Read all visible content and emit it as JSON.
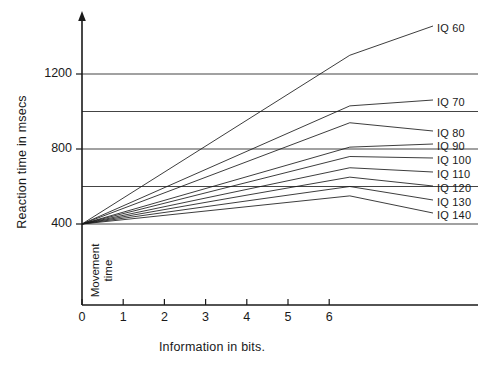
{
  "chart_data": {
    "type": "line",
    "title": "",
    "xlabel": "Information in bits.",
    "ylabel": "Reaction time in msecs",
    "xlim": [
      0,
      6.6
    ],
    "ylim": [
      300,
      1400
    ],
    "xticks": [
      0,
      1,
      2,
      3,
      4,
      5,
      6
    ],
    "xticklabels": [
      "0",
      "1",
      "2",
      "3",
      "4",
      "5",
      "6"
    ],
    "yticks": [
      400,
      800,
      1200
    ],
    "yticklabels": [
      "400",
      "800",
      "1200"
    ],
    "gridlines_y": [
      400,
      600,
      800,
      1000,
      1200
    ],
    "grid": true,
    "legend_position": "right-inline",
    "annotations": [
      {
        "text_line1": "Movement",
        "text_line2": "time",
        "orientation": "vertical"
      }
    ],
    "intercept": 400,
    "x_end": 6.5,
    "series": [
      {
        "name": "IQ 60",
        "label": "IQ 60",
        "slope": 138.5,
        "x": [
          0,
          6.5
        ],
        "values": [
          400,
          1300
        ]
      },
      {
        "name": "IQ 70",
        "label": "IQ 70",
        "slope": 96.9,
        "x": [
          0,
          6.5
        ],
        "values": [
          400,
          1030
        ]
      },
      {
        "name": "IQ 80",
        "label": "IQ 80",
        "slope": 83.1,
        "x": [
          0,
          6.5
        ],
        "values": [
          400,
          940
        ]
      },
      {
        "name": "IQ 90",
        "label": "IQ 90",
        "slope": 63.1,
        "x": [
          0,
          6.5
        ],
        "values": [
          400,
          810
        ]
      },
      {
        "name": "IQ 100",
        "label": "IQ 100",
        "slope": 55.4,
        "x": [
          0,
          6.5
        ],
        "values": [
          400,
          760
        ]
      },
      {
        "name": "IQ 110",
        "label": "IQ 110",
        "slope": 46.2,
        "x": [
          0,
          6.5
        ],
        "values": [
          400,
          700
        ]
      },
      {
        "name": "IQ 120",
        "label": "IQ 120",
        "slope": 38.5,
        "x": [
          0,
          6.5
        ],
        "values": [
          400,
          650
        ]
      },
      {
        "name": "IQ 130",
        "label": "IQ 130",
        "slope": 30.8,
        "x": [
          0,
          6.5
        ],
        "values": [
          400,
          600
        ]
      },
      {
        "name": "IQ 140",
        "label": "IQ 140",
        "slope": 23.1,
        "x": [
          0,
          6.5
        ],
        "values": [
          400,
          550
        ]
      }
    ],
    "colors": {
      "line": "#1a1a1a",
      "grid": "#444444",
      "axis": "#1a1a1a",
      "background": "#ffffff"
    }
  }
}
